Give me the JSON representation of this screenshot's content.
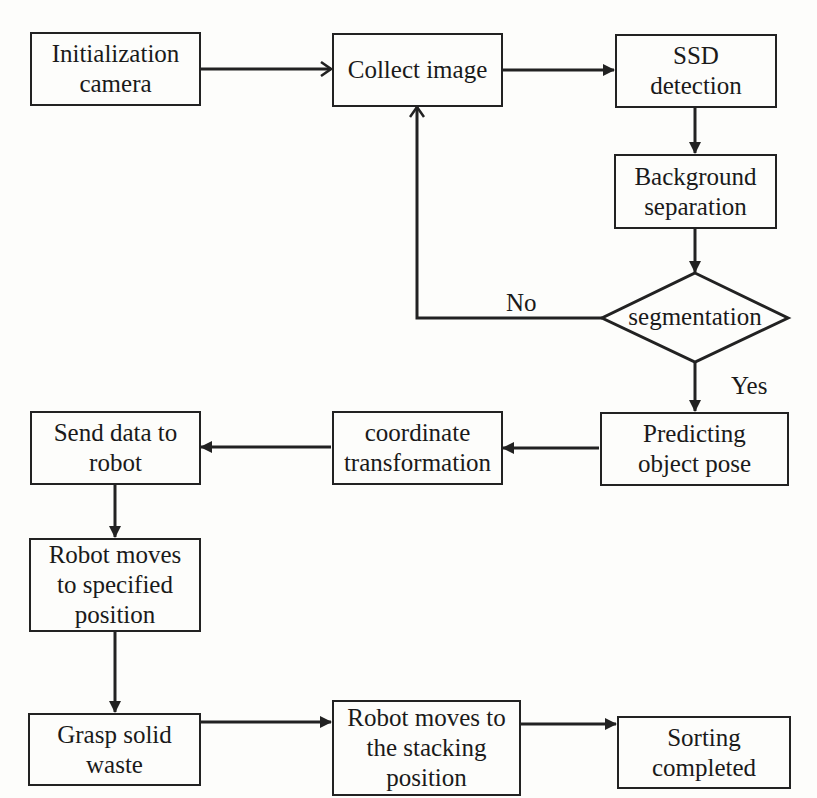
{
  "diagram": {
    "type": "flowchart",
    "colors": {
      "stroke": "#222222",
      "background": "#fdfdfb",
      "text": "#1a1a1a"
    },
    "nodes": {
      "init_camera": {
        "lines": [
          "Initialization",
          "camera"
        ]
      },
      "collect_image": {
        "lines": [
          "Collect image"
        ]
      },
      "ssd_detection": {
        "lines": [
          "SSD",
          "detection"
        ]
      },
      "background_separation": {
        "lines": [
          "Background",
          "separation"
        ]
      },
      "segmentation": {
        "lines": [
          "segmentation"
        ],
        "shape": "diamond"
      },
      "predict_pose": {
        "lines": [
          "Predicting",
          "object pose"
        ]
      },
      "coord_transform": {
        "lines": [
          "coordinate",
          "transformation"
        ]
      },
      "send_data": {
        "lines": [
          "Send data to",
          "robot"
        ]
      },
      "robot_move_specified": {
        "lines": [
          "Robot moves",
          "to specified",
          "position"
        ]
      },
      "grasp_waste": {
        "lines": [
          "Grasp solid",
          "waste"
        ]
      },
      "robot_move_stacking": {
        "lines": [
          "Robot moves to",
          "the stacking",
          "position"
        ]
      },
      "sorting_completed": {
        "lines": [
          "Sorting",
          "completed"
        ]
      }
    },
    "edge_labels": {
      "no": "No",
      "yes": "Yes"
    },
    "edges": [
      {
        "from": "init_camera",
        "to": "collect_image"
      },
      {
        "from": "collect_image",
        "to": "ssd_detection"
      },
      {
        "from": "ssd_detection",
        "to": "background_separation"
      },
      {
        "from": "background_separation",
        "to": "segmentation"
      },
      {
        "from": "segmentation",
        "to": "collect_image",
        "label": "No"
      },
      {
        "from": "segmentation",
        "to": "predict_pose",
        "label": "Yes"
      },
      {
        "from": "predict_pose",
        "to": "coord_transform"
      },
      {
        "from": "coord_transform",
        "to": "send_data"
      },
      {
        "from": "send_data",
        "to": "robot_move_specified"
      },
      {
        "from": "robot_move_specified",
        "to": "grasp_waste"
      },
      {
        "from": "grasp_waste",
        "to": "robot_move_stacking"
      },
      {
        "from": "robot_move_stacking",
        "to": "sorting_completed"
      }
    ]
  }
}
